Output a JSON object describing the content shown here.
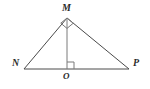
{
  "figure": {
    "background_color": "#ffffff",
    "stroke_color": "#4a4a4a",
    "label_color": "#2b2b2b",
    "stroke_width": 1,
    "labels": {
      "apex": "M",
      "left": "N",
      "right": "P",
      "foot": "O"
    },
    "points": {
      "M": {
        "x": 67,
        "y": 18
      },
      "N": {
        "x": 24,
        "y": 69
      },
      "P": {
        "x": 129,
        "y": 69
      },
      "O": {
        "x": 67,
        "y": 69
      }
    },
    "segments": [
      {
        "name": "MN",
        "from": "M",
        "to": "N"
      },
      {
        "name": "MP",
        "from": "M",
        "to": "P"
      },
      {
        "name": "NP",
        "from": "N",
        "to": "P"
      },
      {
        "name": "MO",
        "from": "M",
        "to": "O"
      }
    ],
    "right_angle_marks": [
      {
        "name": "right-angle-at-M",
        "vertex": "M",
        "size": 8
      },
      {
        "name": "right-angle-at-O",
        "vertex": "O",
        "size": 7
      }
    ]
  }
}
